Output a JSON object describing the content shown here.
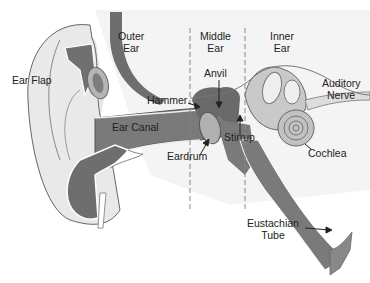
{
  "diagram": {
    "regions": [
      {
        "line1": "Outer",
        "line2": "Ear"
      },
      {
        "line1": "Middle",
        "line2": "Ear"
      },
      {
        "line1": "Inner",
        "line2": "Ear"
      }
    ],
    "labels": {
      "ear_flap": "Ear Flap",
      "ear_canal": "Ear Canal",
      "hammer": "Hammer",
      "anvil": "Anvil",
      "stirrup": "Stirrup",
      "eardrum": "Eardrum",
      "cochlea": "Cochlea",
      "auditory_nerve_1": "Auditory",
      "auditory_nerve_2": "Nerve",
      "eustachian_1": "Eustachian",
      "eustachian_2": "Tube"
    },
    "colors": {
      "dark": "#6e6e6e",
      "mid": "#a9a9a9",
      "light": "#d9d9d9",
      "lighter": "#ececec",
      "outline": "#555555",
      "divider": "#888888"
    }
  }
}
